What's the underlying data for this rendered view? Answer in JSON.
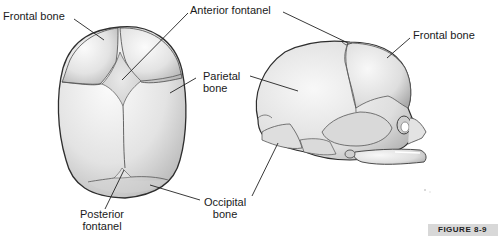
{
  "diagram": {
    "type": "anatomical-illustration",
    "views": [
      {
        "name": "superior-view",
        "labels": [
          {
            "text": "Frontal bone",
            "lines": [
              "Frontal bone"
            ]
          },
          {
            "text": "Anterior fontanel",
            "lines": [
              "Anterior fontanel"
            ]
          },
          {
            "text": "Parietal bone",
            "lines": [
              "Parietal",
              "bone"
            ]
          },
          {
            "text": "Posterior fontanel",
            "lines": [
              "Posterior",
              "fontanel"
            ]
          },
          {
            "text": "Occipital bone",
            "lines": [
              "Occipital",
              "bone"
            ]
          }
        ]
      },
      {
        "name": "lateral-view",
        "labels": [
          {
            "text": "Frontal bone",
            "lines": [
              "Frontal bone"
            ]
          }
        ]
      }
    ],
    "figure_caption": "FIGURE 8-9",
    "colors": {
      "bone_fill": "#e6e6e6",
      "bone_shade": "#b5b5b5",
      "outline": "#3a3a3a",
      "label_text": "#1a1a1a",
      "caption_bg": "#d8d8d8"
    }
  }
}
